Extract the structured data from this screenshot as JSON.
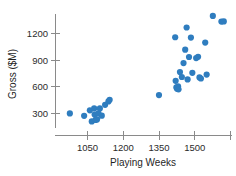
{
  "chart_data": {
    "type": "scatter",
    "title": "",
    "xlabel": "Playing Weeks",
    "ylabel": "Gross ($M)",
    "xlim": [
      975,
      1680
    ],
    "ylim": [
      150,
      1480
    ],
    "xticks": [
      1050,
      1200,
      1350,
      1500,
      1650
    ],
    "xticklabels": [
      "1050",
      "1200",
      "1350",
      "1500",
      ""
    ],
    "yticks": [
      300,
      600,
      900,
      1200
    ],
    "yticklabels": [
      "300",
      "600",
      "900",
      "1200"
    ],
    "grid": false,
    "legend": null,
    "marker_color": "#2f7dbf",
    "marker_size": 3.1,
    "points": [
      {
        "x": 978,
        "y": 295
      },
      {
        "x": 1038,
        "y": 268
      },
      {
        "x": 1062,
        "y": 330
      },
      {
        "x": 1070,
        "y": 205
      },
      {
        "x": 1080,
        "y": 352
      },
      {
        "x": 1082,
        "y": 282
      },
      {
        "x": 1086,
        "y": 222
      },
      {
        "x": 1092,
        "y": 228
      },
      {
        "x": 1098,
        "y": 296
      },
      {
        "x": 1104,
        "y": 352
      },
      {
        "x": 1112,
        "y": 270
      },
      {
        "x": 1126,
        "y": 392
      },
      {
        "x": 1140,
        "y": 430
      },
      {
        "x": 1145,
        "y": 448
      },
      {
        "x": 1352,
        "y": 502
      },
      {
        "x": 1420,
        "y": 1152
      },
      {
        "x": 1422,
        "y": 662
      },
      {
        "x": 1425,
        "y": 588
      },
      {
        "x": 1428,
        "y": 572
      },
      {
        "x": 1432,
        "y": 600
      },
      {
        "x": 1434,
        "y": 566
      },
      {
        "x": 1440,
        "y": 760
      },
      {
        "x": 1448,
        "y": 705
      },
      {
        "x": 1455,
        "y": 862
      },
      {
        "x": 1462,
        "y": 1012
      },
      {
        "x": 1468,
        "y": 1262
      },
      {
        "x": 1472,
        "y": 678
      },
      {
        "x": 1478,
        "y": 930
      },
      {
        "x": 1486,
        "y": 1148
      },
      {
        "x": 1492,
        "y": 752
      },
      {
        "x": 1508,
        "y": 918
      },
      {
        "x": 1516,
        "y": 932
      },
      {
        "x": 1522,
        "y": 700
      },
      {
        "x": 1528,
        "y": 688
      },
      {
        "x": 1546,
        "y": 1092
      },
      {
        "x": 1552,
        "y": 732
      },
      {
        "x": 1578,
        "y": 1392
      },
      {
        "x": 1614,
        "y": 1328
      },
      {
        "x": 1624,
        "y": 1330
      }
    ]
  }
}
